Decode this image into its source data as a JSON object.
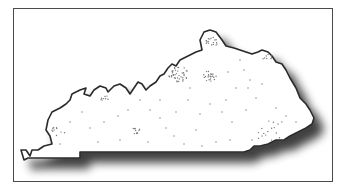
{
  "map": {
    "subject": "Kentucky state outline",
    "style": "outline with drop shadow and stippled population dots",
    "colors": {
      "background": "#ffffff",
      "frame": "#4a4a4a",
      "outline": "#2b2b2b",
      "fill": "#ffffff",
      "dots": "#777777",
      "shadow": "#555555"
    },
    "frame": {
      "x": 13,
      "y": 8,
      "width": 320,
      "height": 174
    },
    "outline_path": "M21,150 L26,150 L30,156 L32,150 L38,150 L44,146 L52,144 L50,136 L46,130 L48,120 L52,112 L60,108 L66,104 L70,100 L72,94 L80,90 L86,88 L84,94 L90,96 L94,90 L100,86 L106,88 L108,92 L114,86 L120,84 L126,88 L130,94 L134,88 L138,82 L142,84 L146,90 L150,86 L156,82 L160,76 L164,74 L168,68 L172,64 L176,66 L180,60 L188,56 L196,52 L202,50 L200,40 L204,32 L210,30 L216,32 L222,40 L226,46 L234,48 L240,50 L246,52 L252,54 L258,52 L262,50 L268,52 L272,56 L276,62 L282,64 L286,70 L290,78 L296,88 L300,98 L306,104 L310,110 L314,118 L312,124 L306,128 L298,132 L290,136 L284,140 L276,140 L268,144 L260,146 L254,146 L250,150 L244,152 L236,152 L80,152 L80,158 L28,158 L24,160 Z",
    "dot_clusters": [
      {
        "name": "paducah-area",
        "cx": 58,
        "cy": 130,
        "count": 10,
        "spread": 8
      },
      {
        "name": "louisville",
        "cx": 178,
        "cy": 74,
        "count": 40,
        "spread": 10
      },
      {
        "name": "lexington",
        "cx": 210,
        "cy": 76,
        "count": 22,
        "spread": 7
      },
      {
        "name": "northern-kentucky",
        "cx": 212,
        "cy": 42,
        "count": 18,
        "spread": 6
      },
      {
        "name": "ashland-area",
        "cx": 268,
        "cy": 58,
        "count": 8,
        "spread": 5
      },
      {
        "name": "bowling-green",
        "cx": 136,
        "cy": 130,
        "count": 10,
        "spread": 5
      },
      {
        "name": "owensboro",
        "cx": 104,
        "cy": 98,
        "count": 8,
        "spread": 5
      },
      {
        "name": "eastern-ridge",
        "cx": 270,
        "cy": 130,
        "count": 14,
        "spread": 16
      }
    ],
    "scattered_dots": [
      [
        90,
        128
      ],
      [
        104,
        122
      ],
      [
        118,
        116
      ],
      [
        128,
        110
      ],
      [
        140,
        100
      ],
      [
        150,
        110
      ],
      [
        160,
        118
      ],
      [
        166,
        128
      ],
      [
        174,
        136
      ],
      [
        184,
        144
      ],
      [
        196,
        130
      ],
      [
        200,
        114
      ],
      [
        210,
        104
      ],
      [
        222,
        112
      ],
      [
        232,
        122
      ],
      [
        246,
        110
      ],
      [
        256,
        98
      ],
      [
        248,
        88
      ],
      [
        236,
        88
      ],
      [
        228,
        72
      ],
      [
        244,
        70
      ],
      [
        250,
        80
      ],
      [
        226,
        100
      ],
      [
        188,
        100
      ],
      [
        176,
        112
      ],
      [
        160,
        100
      ],
      [
        120,
        140
      ],
      [
        98,
        142
      ],
      [
        70,
        122
      ],
      [
        82,
        112
      ],
      [
        60,
        144
      ],
      [
        148,
        142
      ],
      [
        216,
        142
      ],
      [
        230,
        140
      ],
      [
        202,
        146
      ],
      [
        190,
        88
      ],
      [
        240,
        60
      ],
      [
        262,
        84
      ],
      [
        276,
        108
      ],
      [
        286,
        116
      ],
      [
        296,
        122
      ],
      [
        278,
        124
      ],
      [
        262,
        136
      ],
      [
        252,
        140
      ]
    ]
  }
}
